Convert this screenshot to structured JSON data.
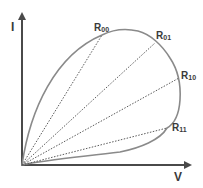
{
  "diagram": {
    "axes": {
      "y_label": "I",
      "x_label": "V"
    },
    "resistance_labels": [
      {
        "main": "R",
        "sub": "00"
      },
      {
        "main": "R",
        "sub": "01"
      },
      {
        "main": "R",
        "sub": "10"
      },
      {
        "main": "R",
        "sub": "11"
      }
    ],
    "colors": {
      "curve": "#8a8a8a",
      "axis": "#4a4a4a",
      "dotted": "#5a5a5a",
      "text": "#3a3a3a"
    }
  }
}
